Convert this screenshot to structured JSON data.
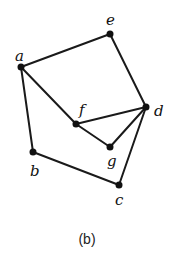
{
  "caption": "(b)",
  "nodes": [
    {
      "id": "a",
      "label": "a",
      "x": 21,
      "y": 67,
      "lx": 15,
      "ly": 61
    },
    {
      "id": "e",
      "label": "e",
      "x": 110,
      "y": 34,
      "lx": 106,
      "ly": 25
    },
    {
      "id": "d",
      "label": "d",
      "x": 146,
      "y": 107,
      "lx": 154,
      "ly": 116
    },
    {
      "id": "f",
      "label": "f",
      "x": 76,
      "y": 124,
      "lx": 79,
      "ly": 115
    },
    {
      "id": "g",
      "label": "g",
      "x": 110,
      "y": 147,
      "lx": 107,
      "ly": 166
    },
    {
      "id": "b",
      "label": "b",
      "x": 33,
      "y": 152,
      "lx": 30,
      "ly": 176
    },
    {
      "id": "c",
      "label": "c",
      "x": 119,
      "y": 185,
      "lx": 115,
      "ly": 205
    }
  ],
  "edges": [
    [
      "a",
      "e"
    ],
    [
      "e",
      "d"
    ],
    [
      "a",
      "f"
    ],
    [
      "a",
      "b"
    ],
    [
      "f",
      "d"
    ],
    [
      "f",
      "g"
    ],
    [
      "g",
      "d"
    ],
    [
      "d",
      "c"
    ],
    [
      "b",
      "c"
    ]
  ]
}
